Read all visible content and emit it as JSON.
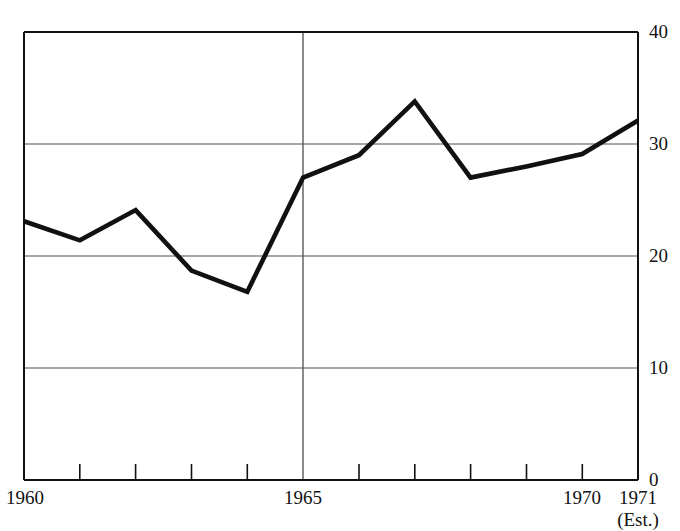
{
  "chart_data": {
    "type": "line",
    "title": "",
    "subtitle": "",
    "xlabel": "",
    "ylabel": "",
    "x": [
      1960,
      1961,
      1962,
      1963,
      1964,
      1965,
      1966,
      1967,
      1968,
      1969,
      1970,
      1971
    ],
    "values": [
      23.1,
      21.4,
      24.1,
      18.7,
      16.8,
      27.0,
      29.0,
      33.8,
      27.0,
      28.0,
      29.1,
      32.1
    ],
    "series": [
      {
        "name": "",
        "values": [
          23.1,
          21.4,
          24.1,
          18.7,
          16.8,
          27.0,
          29.0,
          33.8,
          27.0,
          28.0,
          29.1,
          32.1
        ]
      }
    ],
    "xlim": [
      1960,
      1971
    ],
    "ylim": [
      0,
      40
    ],
    "grid": true,
    "gridlines_y": [
      10,
      20,
      30
    ],
    "legend": "none",
    "y_tick_labels": [
      "40",
      "30",
      "20",
      "10",
      "0"
    ],
    "y_tick_values": [
      40,
      30,
      20,
      10,
      0
    ],
    "x_tick_values": [
      1960,
      1961,
      1962,
      1963,
      1964,
      1965,
      1966,
      1967,
      1968,
      1969,
      1970,
      1971
    ],
    "x_tick_labels_shown": [
      "1960",
      "1965",
      "1970",
      "1971"
    ],
    "annotations": [
      "(Est.)"
    ],
    "line_color": "#111111",
    "grid_color": "#888888",
    "axis_color": "#111111",
    "background_color": "#ffffff"
  },
  "axes": {
    "y_labels": [
      {
        "text": "40",
        "value": 40
      },
      {
        "text": "30",
        "value": 30
      },
      {
        "text": "20",
        "value": 20
      },
      {
        "text": "10",
        "value": 10
      },
      {
        "text": "0",
        "value": 0
      }
    ],
    "x_labels": [
      {
        "text": "1960",
        "value": 1960
      },
      {
        "text": "1965",
        "value": 1965
      },
      {
        "text": "1970",
        "value": 1970
      },
      {
        "text": "1971",
        "value": 1971
      }
    ],
    "estimate_note": "(Est.)"
  }
}
